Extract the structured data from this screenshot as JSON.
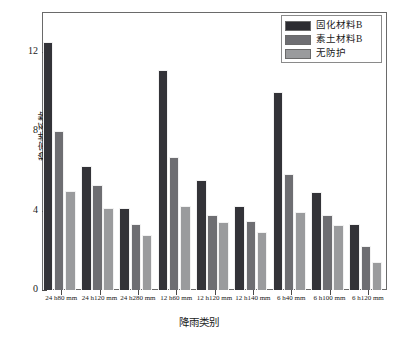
{
  "chart_data": {
    "type": "bar",
    "title": "",
    "xlabel": "降雨类别",
    "ylabel": "稳定性系数",
    "ylim": [
      0,
      14
    ],
    "yticks": [
      0,
      4,
      8,
      12
    ],
    "ytick_labels": [
      "0",
      "4",
      "8",
      "12"
    ],
    "yticks_minor": [
      2,
      6,
      10,
      14
    ],
    "grid": false,
    "legend_position": "top-right",
    "categories": [
      "24 h80 mm",
      "24 h120 mm",
      "24 h280 mm",
      "12 h60 mm",
      "12 h120 mm",
      "12 h140 mm",
      "6 h40 mm",
      "6 h100 mm",
      "6 h120 mm"
    ],
    "series": [
      {
        "name": "固化材料B",
        "color": "#333338",
        "values": [
          12.5,
          6.25,
          4.15,
          11.1,
          5.55,
          4.25,
          9.95,
          4.95,
          3.3
        ]
      },
      {
        "name": "素土材料B",
        "color": "#6e6e72",
        "values": [
          8.0,
          5.3,
          3.3,
          6.7,
          3.8,
          3.5,
          5.85,
          3.8,
          2.2
        ]
      },
      {
        "name": "无防护",
        "color": "#9a9b9d",
        "values": [
          5.0,
          4.15,
          2.75,
          4.25,
          3.4,
          2.9,
          3.95,
          3.25,
          1.4
        ]
      }
    ]
  },
  "legend": {
    "items": [
      {
        "label": "固化材料B",
        "color": "#2c2c31"
      },
      {
        "label": "素土材料B",
        "color": "#6e6e72"
      },
      {
        "label": "无防护",
        "color": "#9a9b9d"
      }
    ]
  },
  "axes": {
    "y_title": "稳定性系数",
    "x_title": "降雨类别"
  }
}
